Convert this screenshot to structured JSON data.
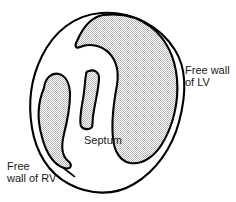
{
  "figure": {
    "background_color": "#ffffff",
    "outline_color": "#000000",
    "fill_color": "#d8d8d8",
    "fill_pattern": "stipple-halftone",
    "text_color": "#1a1a1a"
  },
  "labels": {
    "free_wall_lv": "Free wall\nof LV",
    "free_wall_rv": "Free\nwall of RV",
    "septum": "Septum"
  },
  "regions": [
    {
      "name": "free-wall-of-lv",
      "label": "Free wall of LV",
      "shaded": true
    },
    {
      "name": "free-wall-of-rv",
      "label": "Free wall of RV",
      "shaded": true
    },
    {
      "name": "septum",
      "label": "Septum",
      "shaded": true
    },
    {
      "name": "ventricle-outline",
      "label": "",
      "shaded": false
    }
  ]
}
